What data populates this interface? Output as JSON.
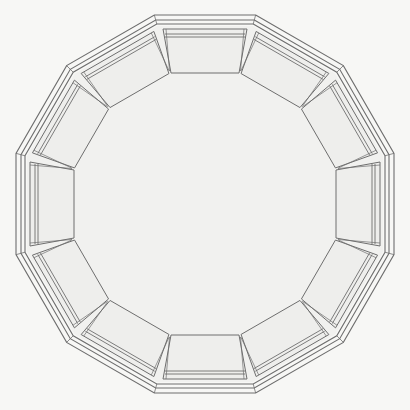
{
  "diagram": {
    "kind": "dodecagonal plan",
    "sides": 12,
    "panel_count": 12,
    "wall_lines": 3,
    "colors": {
      "page": "#f7f7f5",
      "line": "#6e6e6e",
      "panel_fill": "#eeeeec",
      "floor_fill": "#f1f1ef"
    }
  }
}
